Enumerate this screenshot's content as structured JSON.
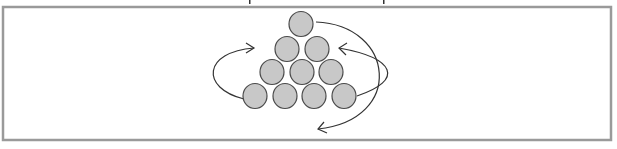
{
  "figure": {
    "frame": {
      "x": 3,
      "y": 7,
      "width": 608,
      "height": 133,
      "stroke": "#9a9a9a",
      "stroke_width": 2.5
    },
    "cutoff_text_fragments": [
      {
        "x": 249,
        "y": 0
      },
      {
        "x": 383,
        "y": 0
      }
    ],
    "circle_style": {
      "fill": "#c8c8c8",
      "stroke": "#4a4a4a",
      "rx": 12,
      "ry": 12.5
    },
    "circles": [
      {
        "row": 1,
        "cx": 301,
        "cy": 24
      },
      {
        "row": 2,
        "cx": 287,
        "cy": 49
      },
      {
        "row": 2,
        "cx": 317,
        "cy": 49
      },
      {
        "row": 3,
        "cx": 272,
        "cy": 72
      },
      {
        "row": 3,
        "cx": 302,
        "cy": 72
      },
      {
        "row": 3,
        "cx": 331,
        "cy": 72
      },
      {
        "row": 4,
        "cx": 255,
        "cy": 96
      },
      {
        "row": 4,
        "cx": 285,
        "cy": 96
      },
      {
        "row": 4,
        "cx": 314,
        "cy": 96
      },
      {
        "row": 4,
        "cx": 344,
        "cy": 96
      }
    ],
    "arrows": [
      {
        "name": "left-loop-arrow",
        "path": "M 244 99 C 200 88, 203 52, 254 48",
        "head": "M 246 43 L 254 48 L 246 53"
      },
      {
        "name": "right-loop-arrow",
        "path": "M 357 96 C 405 80, 395 58, 339 48",
        "head": "M 347 43 L 339 48 L 346 55"
      },
      {
        "name": "top-to-bottom-arrow",
        "path": "M 316 22 C 395 25, 405 120, 318 129",
        "head": "M 324 122 L 318 129 L 327 133"
      }
    ],
    "arrow_stroke": "#333333"
  }
}
